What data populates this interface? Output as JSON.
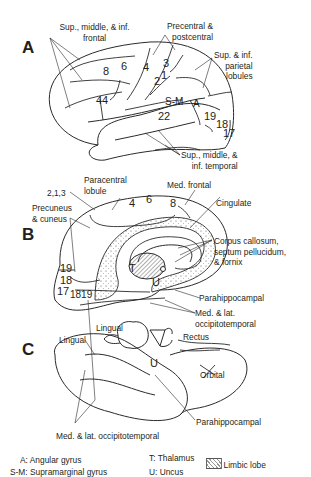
{
  "figure": {
    "panels": [
      {
        "id": "A",
        "label": "A",
        "view": "lateral surface",
        "region_labels": {
          "frontal": "Sup., middle, & inf.\nfrontal",
          "precentral": "Precentral &\npostcentral",
          "parietal": "Sup. & inf.\nparietal\nlobules",
          "temporal": "Sup., middle, &\ninf. temporal"
        },
        "area_numbers": {
          "a8": "8",
          "a6": "6",
          "a4": "4",
          "a3": "3",
          "a1": "1",
          "a2": "2",
          "a44": "44",
          "sm": "S-M",
          "a": "A",
          "a22": "22",
          "a19": "19",
          "a18": "18",
          "a17": "17"
        }
      },
      {
        "id": "B",
        "label": "B",
        "view": "medial surface",
        "region_labels": {
          "paracentral": "Paracentral\nlobule",
          "medfrontal": "Med. frontal",
          "cingulate": "Cingulate",
          "a213": "2,1,3",
          "precuneus": "Precuneus\n& cuneus",
          "corpus": "Corpus callosum,\nseptum pellucidum,\n& fornix",
          "parahippo": "Parahippocampal",
          "occipitotemporal": "Med. & lat.\noccipitotemporal"
        },
        "area_numbers": {
          "a4": "4",
          "a6": "6",
          "a8": "8",
          "a19": "19",
          "a18": "18",
          "a17": "17",
          "a1819": "1819",
          "t": "T",
          "u": "U"
        }
      },
      {
        "id": "C",
        "label": "C",
        "view": "inferior surface",
        "region_labels": {
          "lingual1": "Lingual",
          "lingual2": "Lingual",
          "rectus": "Rectus",
          "orbital": "Orbital",
          "parahippo": "Parahippocampal",
          "occipitotemporal": "Med. & lat. occipitotemporal"
        },
        "area_numbers": {
          "u": "U"
        }
      }
    ],
    "legend": {
      "items": [
        {
          "key": "A",
          "text": "A: Angular gyrus"
        },
        {
          "key": "S-M",
          "text": "S-M: Supramarginal gyrus"
        },
        {
          "key": "T",
          "text": "T: Thalamus"
        },
        {
          "key": "U",
          "text": "U: Uncus"
        }
      ],
      "limbic": "Limbic lobe"
    }
  }
}
